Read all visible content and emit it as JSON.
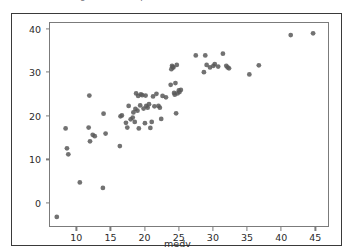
{
  "caption": {
    "top_text_partial": "fig. scatter of predicted vs actual medv"
  },
  "figure": {
    "background_color": "#ffffff",
    "frame_color": "#3a3a3a",
    "axes_color": "#7b7b7b",
    "marker_color": "#595959"
  },
  "chart_data": {
    "type": "scatter",
    "title": "",
    "xlabel": "medv",
    "ylabel": "predicted_medv",
    "xlim": [
      6.0,
      47.0
    ],
    "ylim": [
      -5.5,
      41.5
    ],
    "xticks": [
      10,
      15,
      20,
      25,
      30,
      35,
      40,
      45
    ],
    "yticks": [
      0,
      10,
      20,
      30,
      40
    ],
    "grid": false,
    "legend": null,
    "marker_color": "#595959",
    "marker_size": 18,
    "series": [
      {
        "name": "predicted_medv vs medv",
        "points": [
          [
            7.0,
            -3.4
          ],
          [
            8.3,
            17.1
          ],
          [
            8.5,
            12.5
          ],
          [
            8.7,
            11.1
          ],
          [
            10.4,
            4.6
          ],
          [
            11.8,
            24.7
          ],
          [
            11.7,
            17.3
          ],
          [
            11.9,
            14.1
          ],
          [
            12.3,
            15.6
          ],
          [
            12.6,
            15.3
          ],
          [
            13.8,
            3.3
          ],
          [
            13.9,
            20.5
          ],
          [
            14.2,
            15.9
          ],
          [
            16.3,
            13.0
          ],
          [
            16.4,
            19.9
          ],
          [
            16.6,
            20.1
          ],
          [
            17.2,
            18.4
          ],
          [
            17.4,
            17.3
          ],
          [
            17.6,
            22.3
          ],
          [
            17.9,
            19.2
          ],
          [
            18.2,
            19.6
          ],
          [
            18.3,
            20.8
          ],
          [
            18.5,
            18.6
          ],
          [
            18.6,
            21.6
          ],
          [
            18.7,
            25.2
          ],
          [
            18.9,
            21.2
          ],
          [
            19.0,
            24.6
          ],
          [
            19.1,
            17.1
          ],
          [
            19.3,
            22.4
          ],
          [
            19.4,
            25.0
          ],
          [
            19.6,
            24.8
          ],
          [
            19.8,
            21.7
          ],
          [
            20.0,
            18.3
          ],
          [
            20.1,
            24.7
          ],
          [
            20.2,
            22.3
          ],
          [
            20.4,
            21.9
          ],
          [
            20.6,
            22.7
          ],
          [
            20.8,
            17.2
          ],
          [
            21.0,
            18.6
          ],
          [
            21.2,
            24.5
          ],
          [
            21.4,
            22.2
          ],
          [
            21.7,
            25.1
          ],
          [
            22.0,
            22.3
          ],
          [
            22.2,
            21.9
          ],
          [
            22.4,
            19.3
          ],
          [
            22.6,
            24.6
          ],
          [
            23.1,
            24.3
          ],
          [
            23.8,
            27.2
          ],
          [
            23.9,
            30.8
          ],
          [
            24.0,
            31.6
          ],
          [
            24.1,
            31.3
          ],
          [
            24.2,
            31.2
          ],
          [
            24.3,
            25.3
          ],
          [
            24.4,
            24.9
          ],
          [
            24.5,
            27.6
          ],
          [
            24.6,
            20.6
          ],
          [
            24.7,
            31.8
          ],
          [
            24.8,
            25.2
          ],
          [
            25.0,
            25.9
          ],
          [
            25.1,
            25.5
          ],
          [
            25.3,
            26.0
          ],
          [
            27.5,
            34.0
          ],
          [
            28.7,
            30.1
          ],
          [
            28.9,
            34.0
          ],
          [
            29.1,
            31.8
          ],
          [
            29.6,
            31.2
          ],
          [
            30.1,
            31.6
          ],
          [
            30.3,
            32.0
          ],
          [
            30.8,
            31.4
          ],
          [
            31.5,
            34.4
          ],
          [
            32.0,
            31.6
          ],
          [
            32.2,
            31.2
          ],
          [
            32.4,
            31.0
          ],
          [
            35.4,
            29.6
          ],
          [
            36.8,
            31.7
          ],
          [
            41.5,
            38.7
          ],
          [
            44.8,
            39.1
          ]
        ]
      }
    ]
  }
}
